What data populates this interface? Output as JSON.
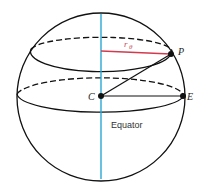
{
  "diagram": {
    "type": "sphere-latitude",
    "labels": {
      "center": "C",
      "point_p": "P",
      "point_e": "E",
      "radius": "r",
      "radius_subscript": "θ",
      "equator": "Equator"
    },
    "colors": {
      "outline": "#111111",
      "axis": "#2aa7d6",
      "radius_line": "#d23a4e",
      "points": "#111111"
    }
  }
}
